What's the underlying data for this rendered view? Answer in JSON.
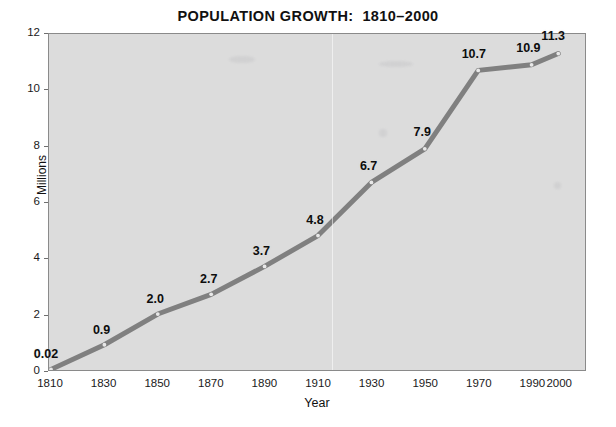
{
  "chart_data": {
    "type": "line",
    "title": "POPULATION GROWTH:  1810–2000",
    "xlabel": "Year",
    "ylabel": "Millions",
    "x": [
      1810,
      1830,
      1850,
      1870,
      1890,
      1910,
      1930,
      1950,
      1970,
      1990,
      2000
    ],
    "values": [
      0.02,
      0.9,
      2.0,
      2.7,
      3.7,
      4.8,
      6.7,
      7.9,
      10.7,
      10.9,
      11.3
    ],
    "point_labels": [
      "0.02",
      "0.9",
      "2.0",
      "2.7",
      "3.7",
      "4.8",
      "6.7",
      "7.9",
      "10.7",
      "10.9",
      "11.3"
    ],
    "xtick_labels": [
      "1810",
      "1830",
      "1850",
      "1870",
      "1890",
      "1910",
      "1930",
      "1950",
      "1970",
      "1990",
      "2000"
    ],
    "ytick_labels": [
      "0",
      "2",
      "4",
      "6",
      "8",
      "10",
      "12"
    ],
    "ytick_values": [
      0,
      2,
      4,
      6,
      8,
      10,
      12
    ],
    "ylim": [
      0,
      12
    ],
    "xlim": [
      1810,
      2000
    ],
    "grid": false,
    "legend": false,
    "series_color": "#808080",
    "marker_color": "#e8e8e8",
    "plot_background": "#dcdcdc",
    "axis_color": "#8a8a8a",
    "text_color": "#111111"
  }
}
